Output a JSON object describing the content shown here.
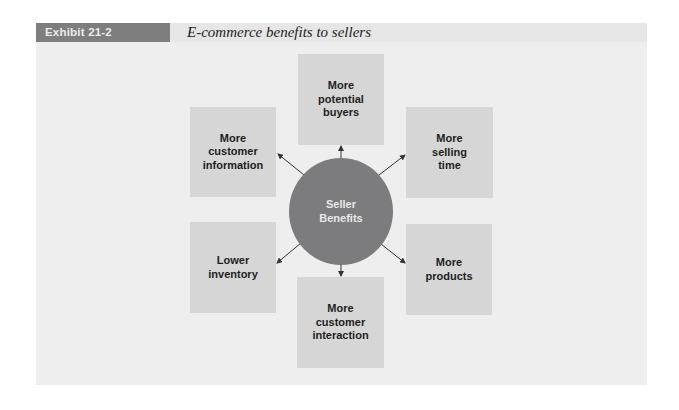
{
  "exhibit": {
    "label": "Exhibit 21-2",
    "title": "E-commerce benefits to sellers"
  },
  "colors": {
    "panel_bg": "#eeeeee",
    "label_bg": "#7e7e80",
    "box_bg": "#d6d6d6",
    "hub_bg": "#7c7b7e",
    "arrow": "#333333"
  },
  "diagram": {
    "hub": {
      "label": "Seller\nBenefits"
    },
    "benefits": [
      {
        "id": "top",
        "label": "More\npotential\nbuyers"
      },
      {
        "id": "top-right",
        "label": "More\nselling\ntime"
      },
      {
        "id": "bottom-right",
        "label": "More\nproducts"
      },
      {
        "id": "bottom",
        "label": "More\ncustomer\ninteraction"
      },
      {
        "id": "bottom-left",
        "label": "Lower\ninventory"
      },
      {
        "id": "top-left",
        "label": "More\ncustomer\ninformation"
      }
    ]
  }
}
